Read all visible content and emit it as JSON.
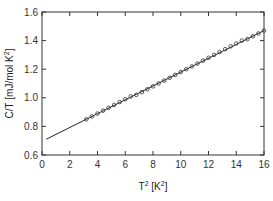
{
  "chart_data": {
    "type": "scatter",
    "title": "",
    "xlabel": "T² [K²]",
    "ylabel": "C/T [mJ/mol K²]",
    "xlim": [
      0,
      16
    ],
    "ylim": [
      0.6,
      1.6
    ],
    "x_ticks": [
      "0",
      "2",
      "4",
      "6",
      "8",
      "10",
      "12",
      "14",
      "16"
    ],
    "y_ticks": [
      "0.6",
      "0.8",
      "1.0",
      "1.2",
      "1.4",
      "1.6"
    ],
    "grid": false,
    "legend": null,
    "series": [
      {
        "name": "data",
        "marker": "open-circle",
        "x": [
          3.2,
          3.6,
          4.0,
          4.4,
          4.8,
          5.2,
          5.6,
          6.0,
          6.4,
          6.8,
          7.2,
          7.6,
          8.0,
          8.4,
          8.8,
          9.2,
          9.6,
          10.0,
          10.4,
          10.8,
          11.2,
          11.6,
          12.0,
          12.4,
          12.8,
          13.2,
          13.6,
          14.0,
          14.4,
          14.8,
          15.2,
          15.6,
          16.0
        ],
        "values": [
          0.85,
          0.87,
          0.89,
          0.91,
          0.93,
          0.95,
          0.97,
          0.99,
          1.01,
          1.02,
          1.04,
          1.06,
          1.08,
          1.1,
          1.12,
          1.14,
          1.16,
          1.18,
          1.2,
          1.22,
          1.24,
          1.26,
          1.28,
          1.3,
          1.32,
          1.34,
          1.36,
          1.38,
          1.4,
          1.41,
          1.43,
          1.45,
          1.47
        ]
      },
      {
        "name": "linear fit",
        "marker": "line",
        "x": [
          0.3,
          16.0
        ],
        "values": [
          0.71,
          1.47
        ]
      }
    ]
  },
  "axes": {
    "xlabel_base": "T",
    "xlabel_sup": "2",
    "xlabel_unit": "[K",
    "xlabel_unit_sup": "2",
    "xlabel_close": "]",
    "ylabel_text": "C/T [mJ/mol K",
    "ylabel_sup": "2",
    "ylabel_close": "]"
  }
}
